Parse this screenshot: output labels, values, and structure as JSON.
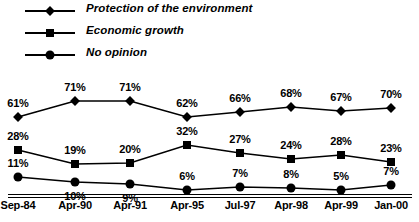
{
  "chart_data": {
    "type": "line",
    "title": "",
    "xlabel": "",
    "ylabel": "",
    "ylim": [
      0,
      100
    ],
    "grid": false,
    "legend_position": "top-left",
    "categories": [
      "Sep-84",
      "Apr-90",
      "Apr-91",
      "Apr-95",
      "Jul-97",
      "Apr-98",
      "Apr-99",
      "Jan-00"
    ],
    "series": [
      {
        "name": "Protection of the environment",
        "marker": "diamond",
        "values": [
          61,
          71,
          71,
          62,
          66,
          68,
          67,
          70
        ],
        "labels": [
          "61%",
          "71%",
          "71%",
          "62%",
          "66%",
          "68%",
          "67%",
          "70%"
        ]
      },
      {
        "name": "Economic growth",
        "marker": "square",
        "values": [
          28,
          19,
          20,
          32,
          27,
          24,
          28,
          23
        ],
        "labels": [
          "28%",
          "19%",
          "20%",
          "32%",
          "27%",
          "24%",
          "28%",
          "23%"
        ]
      },
      {
        "name": "No opinion",
        "marker": "circle",
        "values": [
          11,
          10,
          9,
          6,
          7,
          8,
          5,
          7
        ],
        "labels": [
          "11%",
          "10%",
          "9%",
          "6%",
          "7%",
          "8%",
          "5%",
          "7%"
        ]
      }
    ]
  },
  "legend": {
    "items": [
      {
        "label": "Protection of the environment",
        "marker": "diamond-marker-icon"
      },
      {
        "label": "Economic growth",
        "marker": "square-marker-icon"
      },
      {
        "label": "No opinion",
        "marker": "circle-marker-icon"
      }
    ]
  },
  "colors": {
    "series_line": "#000000",
    "marker": "#000000",
    "axis": "#000000",
    "background": "#ffffff",
    "text": "#000000"
  },
  "geometry": {
    "x_positions": [
      18,
      75,
      130,
      187,
      240,
      291,
      341,
      391
    ],
    "series_y": [
      [
        117,
        101,
        101,
        117,
        112,
        107,
        111,
        108
      ],
      [
        150,
        164,
        163,
        145,
        153,
        159,
        155,
        162
      ],
      [
        177,
        182,
        184,
        190,
        187,
        188,
        190,
        185
      ]
    ],
    "label_y_offsets": [
      -14,
      -14,
      -14
    ],
    "label_y_overrides": {
      "1": [
        null,
        null,
        null,
        null,
        null,
        null,
        null,
        null
      ],
      "2": [
        null,
        14,
        14,
        null,
        null,
        null,
        null,
        null
      ]
    }
  }
}
